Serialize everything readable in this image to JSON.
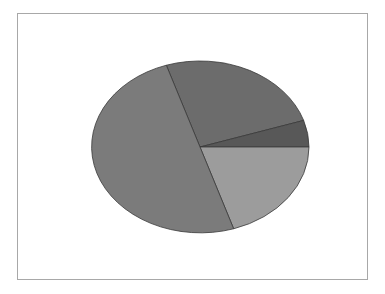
{
  "chart_data": {
    "type": "pie",
    "title": "",
    "legend": "none",
    "start_angle_deg": -108,
    "direction": "clockwise",
    "center": [
      200,
      147
    ],
    "radii": [
      109,
      86
    ],
    "slices": [
      {
        "label": "Slice 1",
        "value": 25,
        "color": "#6c6c6c"
      },
      {
        "label": "Slice 2",
        "value": 5,
        "color": "#585858"
      },
      {
        "label": "Slice 3",
        "value": 20,
        "color": "#9c9c9c"
      },
      {
        "label": "Slice 4",
        "value": 50,
        "color": "#7b7b7b"
      }
    ],
    "edge_color": "#3a3a3a"
  }
}
